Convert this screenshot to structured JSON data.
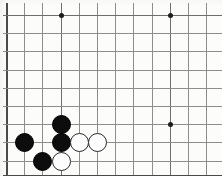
{
  "figure": {
    "kind": "go-board-diagram",
    "board_width_px": 222,
    "board_height_px": 182,
    "background_color": "#fcfcfb",
    "grid_color": "#8d8d8d",
    "edge_color": "#4a4a4a",
    "black_stone_color": "#0d0d0d",
    "white_stone_color": "#fdfdfd",
    "stone_outline_color": "#2a2a2a",
    "star_point_color": "#1c1c1c",
    "cell_size_px": 18.2,
    "origin_x_px": 6,
    "origin_y_px": 15,
    "visible_columns": 12,
    "visible_rows": 10
  },
  "grid": {
    "vertical_lines": [
      {
        "x": 6,
        "y1": 3,
        "y2": 176,
        "style": "edge"
      },
      {
        "x": 24,
        "y1": 3,
        "y2": 176,
        "style": "normal"
      },
      {
        "x": 42,
        "y1": 3,
        "y2": 176,
        "style": "normal"
      },
      {
        "x": 61,
        "y1": 3,
        "y2": 176,
        "style": "strong"
      },
      {
        "x": 79,
        "y1": 3,
        "y2": 176,
        "style": "normal"
      },
      {
        "x": 97,
        "y1": 3,
        "y2": 176,
        "style": "normal"
      },
      {
        "x": 115,
        "y1": 3,
        "y2": 176,
        "style": "normal"
      },
      {
        "x": 133,
        "y1": 3,
        "y2": 176,
        "style": "normal"
      },
      {
        "x": 152,
        "y1": 3,
        "y2": 176,
        "style": "normal"
      },
      {
        "x": 170,
        "y1": 3,
        "y2": 176,
        "style": "strong"
      },
      {
        "x": 188,
        "y1": 3,
        "y2": 176,
        "style": "normal"
      },
      {
        "x": 206,
        "y1": 3,
        "y2": 176,
        "style": "normal"
      }
    ],
    "horizontal_lines": [
      {
        "y": 15,
        "x1": 3,
        "x2": 222,
        "style": "strong"
      },
      {
        "y": 33,
        "x1": 3,
        "x2": 222,
        "style": "normal"
      },
      {
        "y": 51,
        "x1": 3,
        "x2": 222,
        "style": "normal"
      },
      {
        "y": 70,
        "x1": 3,
        "x2": 222,
        "style": "normal"
      },
      {
        "y": 88,
        "x1": 3,
        "x2": 222,
        "style": "normal"
      },
      {
        "y": 106,
        "x1": 3,
        "x2": 222,
        "style": "normal"
      },
      {
        "y": 124,
        "x1": 3,
        "x2": 222,
        "style": "normal"
      },
      {
        "y": 142,
        "x1": 3,
        "x2": 222,
        "style": "normal"
      },
      {
        "y": 161,
        "x1": 3,
        "x2": 222,
        "style": "normal"
      },
      {
        "y": 175,
        "x1": 3,
        "x2": 222,
        "style": "edge"
      }
    ],
    "star_points": [
      {
        "x": 61,
        "y": 15
      },
      {
        "x": 170,
        "y": 15
      },
      {
        "x": 170,
        "y": 124
      }
    ]
  },
  "stones": [
    {
      "color": "black",
      "x": 61,
      "y": 124
    },
    {
      "color": "black",
      "x": 24,
      "y": 142
    },
    {
      "color": "black",
      "x": 61,
      "y": 142
    },
    {
      "color": "black",
      "x": 42,
      "y": 161
    },
    {
      "color": "white",
      "x": 79,
      "y": 142
    },
    {
      "color": "white",
      "x": 97,
      "y": 142
    },
    {
      "color": "white",
      "x": 61,
      "y": 161
    }
  ],
  "counts": {
    "black_stones": 4,
    "white_stones": 3,
    "star_points": 3
  }
}
